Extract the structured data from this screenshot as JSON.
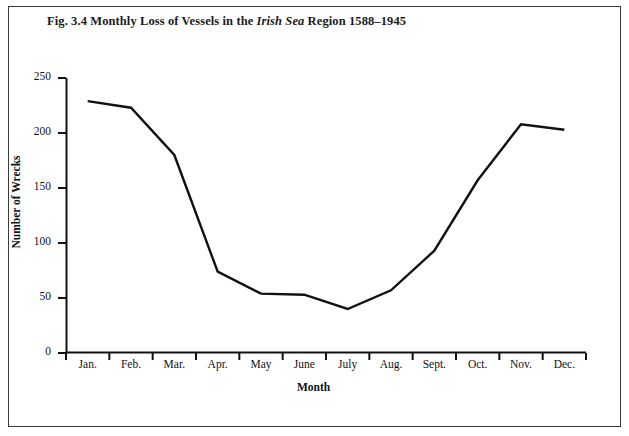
{
  "figure": {
    "title_prefix": "Fig. 3.4 Monthly Loss of Vessels in the ",
    "title_italic": "Irish Sea",
    "title_suffix": " Region 1588–1945",
    "title_full": "Fig. 3.4 Monthly Loss of Vessels in the Irish Sea Region 1588–1945",
    "border_color": "#3a3a3a",
    "background_color": "#ffffff",
    "line_color": "#111111"
  },
  "chart_data": {
    "type": "line",
    "title": "Fig. 3.4 Monthly Loss of Vessels in the Irish Sea Region 1588–1945",
    "xlabel": "Month",
    "ylabel": "Number of Wrecks",
    "categories": [
      "Jan.",
      "Feb.",
      "Mar.",
      "Apr.",
      "May",
      "June",
      "July",
      "Aug.",
      "Sept.",
      "Oct.",
      "Nov.",
      "Dec."
    ],
    "values": [
      229,
      223,
      180,
      74,
      54,
      53,
      40,
      57,
      93,
      157,
      208,
      203
    ],
    "series": [
      {
        "name": "Number of Wrecks",
        "values": [
          229,
          223,
          180,
          74,
          54,
          53,
          40,
          57,
          93,
          157,
          208,
          203
        ]
      }
    ],
    "ylim": [
      0,
      250
    ],
    "yticks": [
      0,
      50,
      100,
      150,
      200,
      250
    ],
    "ytick_labels": [
      "0",
      "50",
      "100",
      "150",
      "200",
      "250"
    ],
    "grid": false,
    "legend": false,
    "legend_position": "none"
  }
}
